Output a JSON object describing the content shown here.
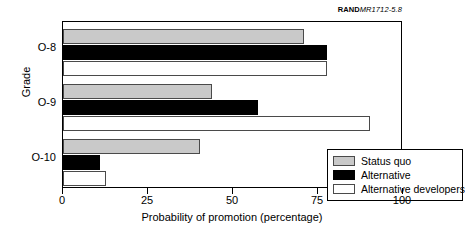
{
  "source_tag": {
    "brand": "RAND",
    "reference": "MR1712-5.8"
  },
  "chart_data": {
    "type": "bar",
    "orientation": "horizontal",
    "title": "",
    "xlabel": "Probability of promotion (percentage)",
    "ylabel": "Grade",
    "categories": [
      "O-8",
      "O-9",
      "O-10"
    ],
    "xlim": [
      0,
      100
    ],
    "xticks": [
      0,
      25,
      50,
      75,
      100
    ],
    "xticklabels": [
      "0",
      "25",
      "50",
      "75",
      "100"
    ],
    "grid": false,
    "legend_position": "lower right",
    "series": [
      {
        "name": "Status quo",
        "color": "#c9c9c9",
        "values": [
          70.8,
          43.8,
          40.3
        ]
      },
      {
        "name": "Alternative",
        "color": "#000000",
        "values": [
          77.5,
          57.4,
          11.0
        ]
      },
      {
        "name": "Alternative developers",
        "color": "#ffffff",
        "values": [
          77.5,
          90.3,
          12.6
        ]
      }
    ]
  }
}
